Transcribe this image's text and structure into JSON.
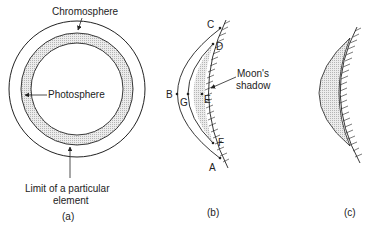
{
  "panels": {
    "a": {
      "caption": "(a)",
      "labels": {
        "chromosphere": "Chromosphere",
        "photosphere": "Photosphere",
        "limit_line1": "Limit of a particular",
        "limit_line2": "element"
      }
    },
    "b": {
      "caption": "(b)",
      "points": {
        "A": "A",
        "B": "B",
        "C": "C",
        "D": "D",
        "E": "E",
        "F": "F",
        "G": "G"
      },
      "labels": {
        "moon_line1": "Moon's",
        "moon_line2": "shadow"
      }
    },
    "c": {
      "caption": "(c)"
    }
  },
  "colors": {
    "line": "#222222",
    "shade": "#d8d8d8",
    "background": "#ffffff"
  }
}
